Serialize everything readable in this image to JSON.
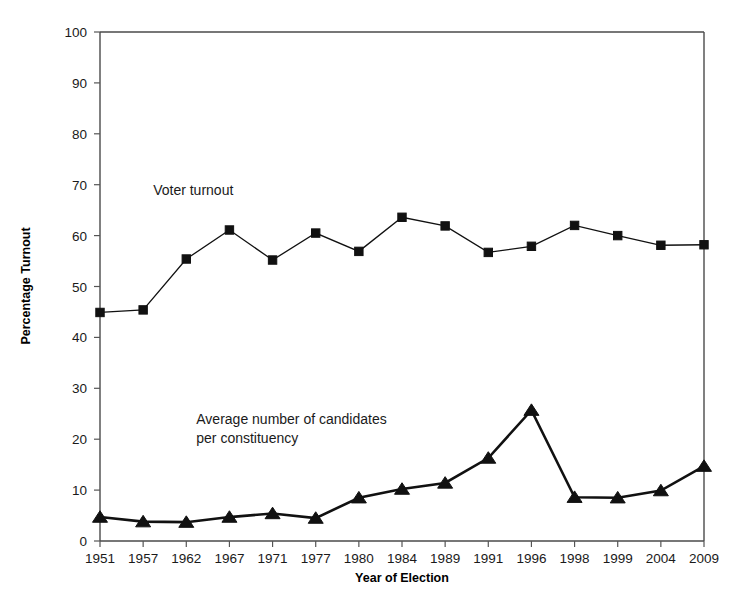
{
  "chart_data": {
    "type": "line",
    "title": "",
    "xlabel": "Year of Election",
    "ylabel": "Percentage Turnout",
    "categories": [
      "1951",
      "1957",
      "1962",
      "1967",
      "1971",
      "1977",
      "1980",
      "1984",
      "1989",
      "1991",
      "1996",
      "1998",
      "1999",
      "2004",
      "2009"
    ],
    "ylim": [
      0,
      100
    ],
    "yticks": [
      0,
      10,
      20,
      30,
      40,
      50,
      60,
      70,
      80,
      90,
      100
    ],
    "grid": false,
    "legend_position": "inline-annotations",
    "series": [
      {
        "name": "Voter turnout",
        "marker": "square",
        "values": [
          44.9,
          45.4,
          55.4,
          61.1,
          55.2,
          60.5,
          56.9,
          63.6,
          61.9,
          56.7,
          57.9,
          62.0,
          60.0,
          58.1,
          58.2
        ]
      },
      {
        "name": "Average number of candidates per constituency",
        "marker": "triangle",
        "values": [
          4.7,
          3.8,
          3.7,
          4.7,
          5.4,
          4.5,
          8.5,
          10.2,
          11.4,
          16.3,
          25.7,
          8.6,
          8.5,
          9.9,
          14.7
        ]
      }
    ],
    "annotations": [
      {
        "text": "Voter turnout",
        "x_value": "1957",
        "y_value": 68,
        "lines": [
          "Voter turnout"
        ]
      },
      {
        "text": "Average number of candidates per constituency",
        "x_value": "1962",
        "y_value": 23,
        "lines": [
          "Average number of candidates",
          "per constituency"
        ]
      }
    ],
    "colors": {
      "series_line": "#111111",
      "marker": "#111111",
      "axis": "#4a4a4a",
      "text": "#1a1a1a",
      "background": "#ffffff"
    }
  }
}
